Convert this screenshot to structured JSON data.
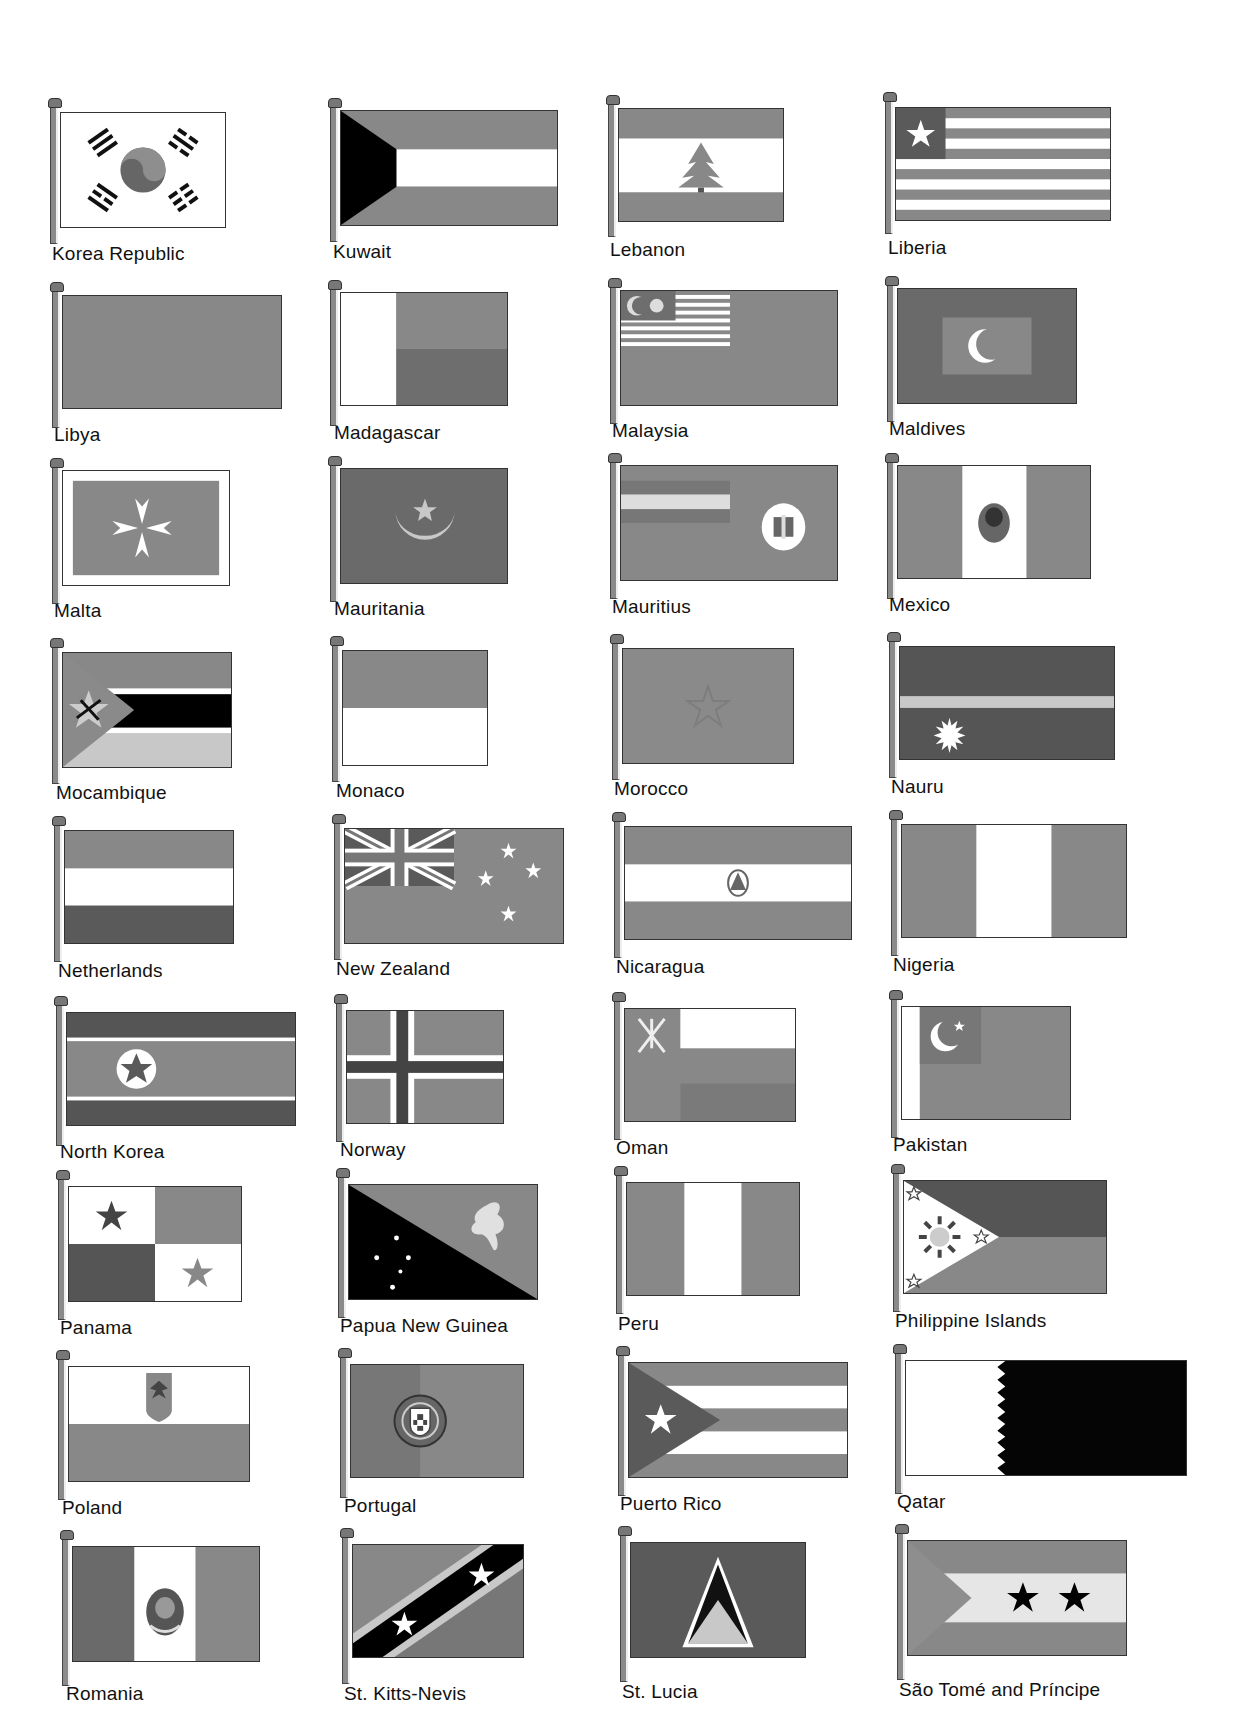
{
  "palette": {
    "white": "#ffffff",
    "light": "#bdbdbd",
    "mid": "#888888",
    "dark": "#5a5a5a",
    "black": "#0a0a0a"
  },
  "flags": [
    {
      "name": "Korea Republic"
    },
    {
      "name": "Kuwait"
    },
    {
      "name": "Lebanon"
    },
    {
      "name": "Liberia"
    },
    {
      "name": "Libya"
    },
    {
      "name": "Madagascar"
    },
    {
      "name": "Malaysia"
    },
    {
      "name": "Maldives"
    },
    {
      "name": "Malta"
    },
    {
      "name": "Mauritania"
    },
    {
      "name": "Mauritius"
    },
    {
      "name": "Mexico"
    },
    {
      "name": "Mocambique"
    },
    {
      "name": "Monaco"
    },
    {
      "name": "Morocco"
    },
    {
      "name": "Nauru"
    },
    {
      "name": "Netherlands"
    },
    {
      "name": "New Zealand"
    },
    {
      "name": "Nicaragua"
    },
    {
      "name": "Nigeria"
    },
    {
      "name": "North Korea"
    },
    {
      "name": "Norway"
    },
    {
      "name": "Oman"
    },
    {
      "name": "Pakistan"
    },
    {
      "name": "Panama"
    },
    {
      "name": "Papua New Guinea"
    },
    {
      "name": "Peru"
    },
    {
      "name": "Philippine Islands"
    },
    {
      "name": "Poland"
    },
    {
      "name": "Portugal"
    },
    {
      "name": "Puerto Rico"
    },
    {
      "name": "Qatar"
    },
    {
      "name": "Romania"
    },
    {
      "name": "St. Kitts-Nevis"
    },
    {
      "name": "St. Lucia"
    },
    {
      "name": "São Tomé and Príncipe"
    }
  ]
}
